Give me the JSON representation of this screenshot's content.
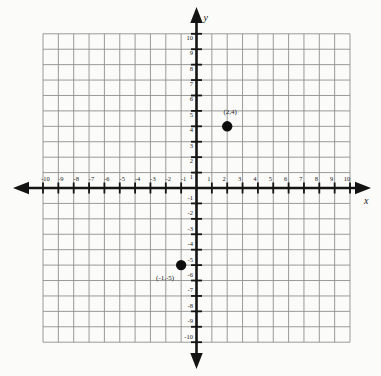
{
  "figure": {
    "background": "#fbfbf9",
    "grid_color": "#8f8f8f",
    "axis_color": "#141414",
    "tick_color": "#141414",
    "text_color": "#222222",
    "point_color": "#0d0d0d"
  },
  "chart_data": {
    "type": "scatter",
    "title": "",
    "xlabel": "x",
    "ylabel": "y",
    "xlim": [
      -10,
      10
    ],
    "ylim": [
      -10,
      10
    ],
    "grid": true,
    "grid_step": 1,
    "legend": "none",
    "x_tick_values": [
      -10,
      -9,
      -8,
      -7,
      -6,
      -5,
      -4,
      -3,
      -2,
      -1,
      1,
      2,
      3,
      4,
      5,
      6,
      7,
      8,
      9,
      10
    ],
    "y_tick_values": [
      10,
      9,
      8,
      7,
      6,
      5,
      4,
      3,
      2,
      1,
      -1,
      -2,
      -3,
      -4,
      -5,
      -6,
      -7,
      -8,
      -9,
      -10
    ],
    "points": [
      {
        "x": 2,
        "y": 4,
        "label": "(2,4)",
        "label_placement": "above",
        "label_dx": 3,
        "label_dy": -12
      },
      {
        "x": -1,
        "y": -5,
        "label": "(-1,-5)",
        "label_placement": "below-left",
        "label_dx": -16,
        "label_dy": 15
      }
    ]
  }
}
